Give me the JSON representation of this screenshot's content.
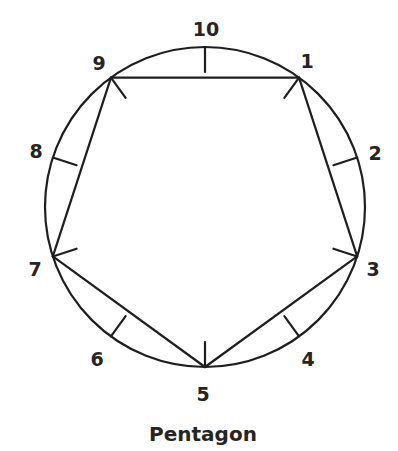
{
  "figure": {
    "title": "Pentagon",
    "circle": {
      "cx": 205,
      "cy": 207,
      "r": 160
    },
    "tick_length": 25,
    "stroke_color": "#1e1e1e",
    "text_color": "#252525",
    "points": [
      {
        "label": "1",
        "angle_deg": 54,
        "lx": 307,
        "ly": 68
      },
      {
        "label": "2",
        "angle_deg": 18,
        "lx": 375,
        "ly": 160
      },
      {
        "label": "3",
        "angle_deg": -18,
        "lx": 373,
        "ly": 276
      },
      {
        "label": "4",
        "angle_deg": -54,
        "lx": 308,
        "ly": 366
      },
      {
        "label": "5",
        "angle_deg": -90,
        "lx": 203,
        "ly": 401
      },
      {
        "label": "6",
        "angle_deg": 234,
        "lx": 97,
        "ly": 366
      },
      {
        "label": "7",
        "angle_deg": 198,
        "lx": 35,
        "ly": 276
      },
      {
        "label": "8",
        "angle_deg": 162,
        "lx": 36,
        "ly": 158
      },
      {
        "label": "9",
        "angle_deg": 126,
        "lx": 99,
        "ly": 70
      },
      {
        "label": "10",
        "angle_deg": 90,
        "lx": 206,
        "ly": 36
      }
    ],
    "pentagon_path": [
      "1",
      "3",
      "5",
      "7",
      "9",
      "1"
    ]
  }
}
